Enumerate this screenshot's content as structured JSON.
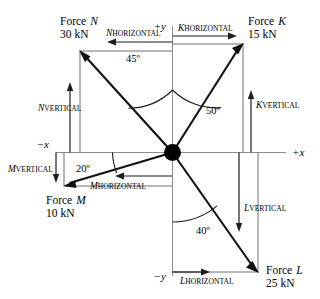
{
  "diagram": {
    "type": "force-vector-diagram",
    "title": "",
    "origin": {
      "x": 172,
      "y": 152
    },
    "axes": {
      "x_label_negative": "−x",
      "x_label_positive": "+x",
      "y_label_positive": "+y",
      "y_label_negative": "−y",
      "x_min": 56,
      "x_max": 286,
      "y_min": 26,
      "y_max": 276
    },
    "forces": [
      {
        "id": "N",
        "name_line1": "Force",
        "name_letter": "N",
        "magnitude": "30 kN",
        "quadrant": "upper-left",
        "angle_deg": 45,
        "angle_label": "45º",
        "angle_from": "+y axis",
        "horizontal_component_label_letter": "N",
        "horizontal_component_label_sub": "HORIZONTAL",
        "vertical_component_label_letter": "N",
        "vertical_component_label_sub": "VERTICAL",
        "tip": {
          "x": 80,
          "y": 51
        }
      },
      {
        "id": "K",
        "name_line1": "Force",
        "name_letter": "K",
        "magnitude": "15 kN",
        "quadrant": "upper-right",
        "angle_deg": 50,
        "angle_label": "50º",
        "angle_from": "+y axis",
        "horizontal_component_label_letter": "K",
        "horizontal_component_label_sub": "HORIZONTAL",
        "vertical_component_label_letter": "K",
        "vertical_component_label_sub": "VERTICAL",
        "tip": {
          "x": 243,
          "y": 44
        }
      },
      {
        "id": "M",
        "name_line1": "Force",
        "name_letter": "M",
        "magnitude": "10 kN",
        "quadrant": "lower-left",
        "angle_deg": 20,
        "angle_label": "20º",
        "angle_from": "−x axis",
        "horizontal_component_label_letter": "M",
        "horizontal_component_label_sub": "HORIZONTAL",
        "vertical_component_label_letter": "M",
        "vertical_component_label_sub": "VERTICAL",
        "tip": {
          "x": 64,
          "y": 186
        }
      },
      {
        "id": "L",
        "name_line1": "Force",
        "name_letter": "L",
        "magnitude": "25 kN",
        "quadrant": "lower-right",
        "angle_deg": 40,
        "angle_label": "40º",
        "angle_from": "−y axis",
        "horizontal_component_label_letter": "L",
        "horizontal_component_label_sub": "HORIZONTAL",
        "vertical_component_label_letter": "L",
        "vertical_component_label_sub": "VERTICAL",
        "tip": {
          "x": 258,
          "y": 272
        }
      }
    ],
    "colors": {
      "vector": "#0d0d0d",
      "axis": "#8c8c8c",
      "component": "#6f6f6f",
      "background": "#ffffff",
      "text": "#000000"
    }
  }
}
